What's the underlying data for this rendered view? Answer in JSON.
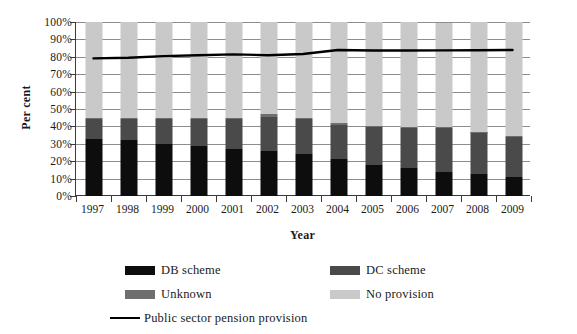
{
  "chart_data": {
    "type": "bar",
    "variant": "stacked-bar-with-line-overlay",
    "title": "",
    "xlabel": "Year",
    "ylabel": "Per cent",
    "categories": [
      "1997",
      "1998",
      "1999",
      "2000",
      "2001",
      "2002",
      "2003",
      "2004",
      "2005",
      "2006",
      "2007",
      "2008",
      "2009"
    ],
    "ylim": [
      0,
      100
    ],
    "ytick_labels": [
      "0%",
      "10%",
      "20%",
      "30%",
      "40%",
      "50%",
      "60%",
      "70%",
      "80%",
      "90%",
      "100%"
    ],
    "ytick_values": [
      0,
      10,
      20,
      30,
      40,
      50,
      60,
      70,
      80,
      90,
      100
    ],
    "grid": true,
    "grid_axis": "y",
    "legend_position": "bottom",
    "series": [
      {
        "name": "DB scheme",
        "color": "#0d0d0d",
        "type": "bar-segment",
        "values": [
          33,
          32,
          30,
          28.5,
          27,
          26,
          24,
          21,
          18,
          16,
          14,
          12.5,
          11
        ]
      },
      {
        "name": "DC scheme",
        "color": "#4a4a4a",
        "type": "bar-segment",
        "values": [
          11,
          12,
          14,
          15.5,
          17,
          19.5,
          20,
          20,
          21.5,
          23,
          25,
          24,
          23
        ]
      },
      {
        "name": "Unknown",
        "color": "#6e6e6e",
        "type": "bar-segment",
        "values": [
          1,
          1,
          1,
          1,
          1,
          1.5,
          1,
          1,
          0.5,
          0.5,
          0.5,
          0.5,
          0.5
        ]
      },
      {
        "name": "No provision",
        "color": "#c9c9c9",
        "type": "bar-segment",
        "values": [
          55,
          55,
          55,
          55,
          55,
          53,
          55,
          58,
          60,
          60.5,
          60,
          63,
          65.5
        ]
      },
      {
        "name": "Public sector pension provision",
        "color": "#000000",
        "type": "line",
        "values": [
          79.0,
          79.3,
          80.3,
          80.8,
          81.3,
          80.8,
          81.5,
          83.8,
          83.5,
          83.5,
          83.6,
          83.7,
          83.8
        ]
      }
    ]
  },
  "axes": {
    "x_title": "Year",
    "y_title": "Per cent"
  },
  "legend": {
    "items": [
      {
        "label": "DB scheme",
        "swatch": "solid",
        "color": "#0d0d0d"
      },
      {
        "label": "DC scheme",
        "swatch": "solid",
        "color": "#4a4a4a"
      },
      {
        "label": "Unknown",
        "swatch": "solid",
        "color": "#6e6e6e"
      },
      {
        "label": "No provision",
        "swatch": "solid",
        "color": "#c9c9c9"
      },
      {
        "label": "Public sector pension provision",
        "swatch": "line",
        "color": "#000000"
      }
    ]
  }
}
